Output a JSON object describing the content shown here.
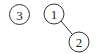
{
  "diagram": {
    "type": "graph",
    "nodes": [
      {
        "id": "3",
        "label": "3",
        "cx": 19.5,
        "cy": 14.5,
        "r": 10
      },
      {
        "id": "1",
        "label": "1",
        "cx": 54,
        "cy": 14,
        "r": 10
      },
      {
        "id": "2",
        "label": "2",
        "cx": 79,
        "cy": 42,
        "r": 10
      }
    ],
    "edges": [
      {
        "from": "1",
        "to": "2"
      }
    ],
    "colors": {
      "stroke": "#333333",
      "background": "#ffffff",
      "text": "#222222"
    }
  }
}
